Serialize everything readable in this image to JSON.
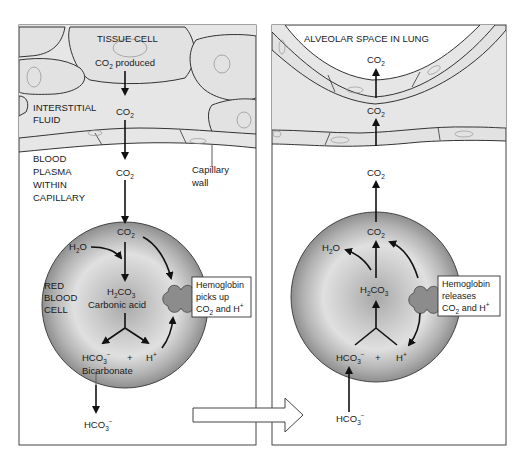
{
  "left_panel": {
    "title": "TISSUE CELL",
    "co2_produced": "CO",
    "co2_produced_sub": "2",
    "co2_produced_suffix": " produced",
    "interstitial_label_line1": "INTERSTITIAL",
    "interstitial_label_line2": "FLUID",
    "co2_interstitial": "CO",
    "co2_interstitial_sub": "2",
    "plasma_label_line1": "BLOOD",
    "plasma_label_line2": "PLASMA",
    "plasma_label_line3": "WITHIN",
    "plasma_label_line4": "CAPILLARY",
    "co2_plasma": "CO",
    "co2_plasma_sub": "2",
    "capillary_wall_line1": "Capillary",
    "capillary_wall_line2": "wall",
    "rbc_label_line1": "RED",
    "rbc_label_line2": "BLOOD",
    "rbc_label_line3": "CELL",
    "co2_rbc": "CO",
    "co2_rbc_sub": "2",
    "h2o_h": "H",
    "h2o_sub": "2",
    "h2o_o": "O",
    "h2co3_h": "H",
    "h2co3_sub1": "2",
    "h2co3_co": "CO",
    "h2co3_sub2": "3",
    "carbonic_acid": "Carbonic acid",
    "hco3_main": "HCO",
    "hco3_sub": "3",
    "hco3_sup": "−",
    "plus": "+",
    "h_plus_main": "H",
    "h_plus_sup": "+",
    "bicarbonate": "Bicarbonate",
    "hco3_out_main": "HCO",
    "hco3_out_sub": "3",
    "hco3_out_sup": "−",
    "hemoglobin_box_line1": "Hemoglobin",
    "hemoglobin_box_line2": "picks up",
    "hemoglobin_box_line3_a": "CO",
    "hemoglobin_box_line3_sub": "2",
    "hemoglobin_box_line3_b": " and H",
    "hemoglobin_box_line3_sup": "+"
  },
  "right_panel": {
    "title": "ALVEOLAR SPACE IN LUNG",
    "co2_alveolar": "CO",
    "co2_alveolar_sub": "2",
    "co2_interstitial": "CO",
    "co2_interstitial_sub": "2",
    "co2_plasma": "CO",
    "co2_plasma_sub": "2",
    "co2_rbc": "CO",
    "co2_rbc_sub": "2",
    "h2o_h": "H",
    "h2o_sub": "2",
    "h2o_o": "O",
    "h2co3_h": "H",
    "h2co3_sub1": "2",
    "h2co3_co": "CO",
    "h2co3_sub2": "3",
    "hco3_main": "HCO",
    "hco3_sub": "3",
    "hco3_sup": "−",
    "plus": "+",
    "h_plus_main": "H",
    "h_plus_sup": "+",
    "hco3_in_main": "HCO",
    "hco3_in_sub": "3",
    "hco3_in_sup": "−",
    "hemoglobin_box_line1": "Hemoglobin",
    "hemoglobin_box_line2": "releases",
    "hemoglobin_box_line3_a": "CO",
    "hemoglobin_box_line3_sub": "2",
    "hemoglobin_box_line3_b": " and H",
    "hemoglobin_box_line3_sup": "+"
  },
  "colors": {
    "tissue_fill": "#e6e6e6",
    "cell_stroke": "#333333",
    "rbc_dark": "#8a8a8a",
    "rbc_light": "#d4d4d4",
    "hemoglobin_fill": "#8c8c8c",
    "arrow": "#111111",
    "panel_border": "#444444"
  }
}
